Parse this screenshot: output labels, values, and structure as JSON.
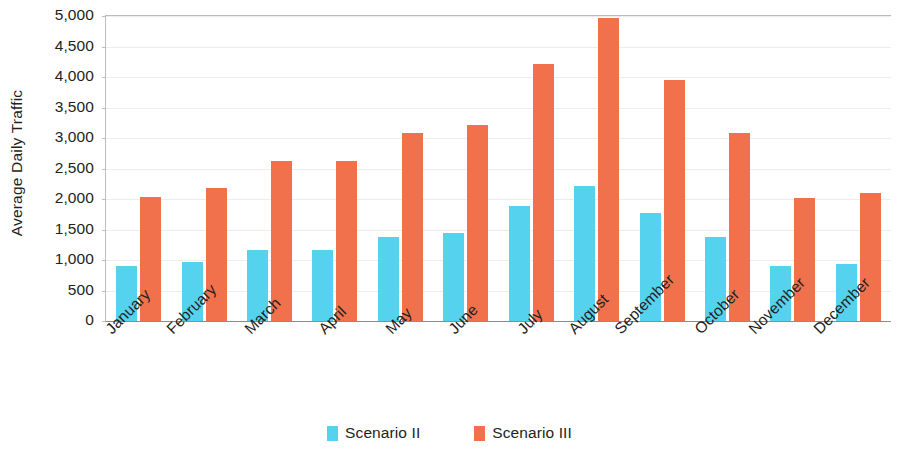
{
  "chart_data": {
    "type": "bar",
    "title": "",
    "subtitle": "",
    "xlabel": "",
    "ylabel": "Average Daily Traffic",
    "ylim": [
      0,
      5000
    ],
    "y_tick_step": 500,
    "y_tick_labels": [
      "5,000",
      "4,500",
      "4,000",
      "3,500",
      "3,000",
      "2,500",
      "2,000",
      "1,500",
      "1,000",
      "500",
      "0"
    ],
    "y_tick_values": [
      5000,
      4500,
      4000,
      3500,
      3000,
      2500,
      2000,
      1500,
      1000,
      500,
      0
    ],
    "categories": [
      "January",
      "February",
      "March",
      "April",
      "May",
      "June",
      "July",
      "August",
      "September",
      "October",
      "November",
      "December"
    ],
    "series": [
      {
        "name": "Scenario II",
        "color": "#55d2ee",
        "values": [
          900,
          970,
          1170,
          1170,
          1380,
          1440,
          1890,
          2210,
          1770,
          1380,
          910,
          940
        ]
      },
      {
        "name": "Scenario III",
        "color": "#f1714d",
        "values": [
          2040,
          2180,
          2620,
          2620,
          3080,
          3210,
          4210,
          4960,
          3950,
          3080,
          2020,
          2100
        ]
      }
    ],
    "legend": {
      "position": "bottom",
      "entries": [
        {
          "label": "Scenario II",
          "color": "#55d2ee"
        },
        {
          "label": "Scenario III",
          "color": "#f1714d"
        }
      ]
    },
    "grid": {
      "horizontal": true,
      "vertical": false,
      "color": "#ededed"
    },
    "axis": {
      "x_label_rotation_deg": -45,
      "axis_line_color": "#8d8d8d",
      "tick_color": "#bcbcbc"
    },
    "background_color": "#ffffff"
  }
}
